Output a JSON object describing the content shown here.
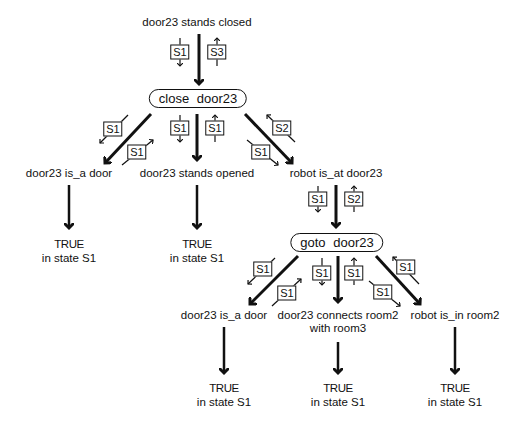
{
  "diagram": {
    "root_goal": "door23 stands closed",
    "root_states": {
      "down": "S1",
      "up": "S3"
    },
    "op1": {
      "label": "close  door23",
      "preconditions": [
        {
          "label": "door23 is_a door",
          "state_in": "S1",
          "state_out": "S1",
          "result": "TRUE",
          "result_state": "in state S1"
        },
        {
          "label": "door23 stands opened",
          "state_in": "S1",
          "state_out": "S1",
          "result": "TRUE",
          "result_state": "in state S1"
        },
        {
          "label": "robot  is_at  door23",
          "state_in": "S1",
          "state_out": "S2"
        }
      ]
    },
    "op2_link_states": {
      "down": "S1",
      "up": "S2"
    },
    "op2": {
      "label": "goto  door23",
      "preconditions": [
        {
          "label": "door23  is_a  door",
          "state_in": "S1",
          "state_out": "S1",
          "result": "TRUE",
          "result_state": "in state S1"
        },
        {
          "label": "door23 connects room2",
          "label2": "with  room3",
          "state_in": "S1",
          "state_out": "S1",
          "result": "TRUE",
          "result_state": "in state S1"
        },
        {
          "label": "robot  is_in  room2",
          "state_in": "S1",
          "state_out": "S1",
          "result": "TRUE",
          "result_state": "in state S1"
        }
      ]
    }
  }
}
